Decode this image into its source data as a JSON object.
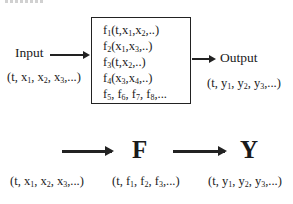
{
  "diagram": {
    "top": {
      "input_label": "Input",
      "input_tuple": "(t, x1, x2, x3,...)",
      "box_functions": [
        "f1(t,x1,x2,..)",
        "f2(x1,x3,..)",
        "f3(t,x2,..)",
        "f4(x3,x4,..)",
        "f5, f6, f7, f8,..."
      ],
      "output_label": "Output",
      "output_tuple": "(t, y1, y2, y3,...)"
    },
    "bottom": {
      "node_f": "F",
      "node_y": "Y",
      "input_tuple": "(t, x1, x2, x3,...)",
      "f_tuple": "(t, f1, f2, f3,...)",
      "y_tuple": "(t, y1, y2, y3,...)"
    },
    "colors": {
      "line": "#222222",
      "text": "#1a1a1a",
      "background": "#ffffff"
    }
  }
}
